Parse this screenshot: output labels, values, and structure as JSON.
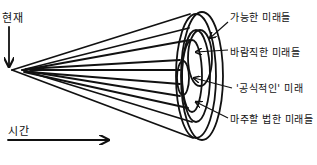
{
  "diagram": {
    "type": "futures-cone",
    "present_label": "현재",
    "time_label": "시간",
    "cone_labels": [
      "가능한 미래들",
      "바람직한 미래들",
      "'공식적인' 미래",
      "마주할 법한 미래들"
    ],
    "colors": {
      "stroke": "#111111",
      "background": "#ffffff"
    }
  }
}
